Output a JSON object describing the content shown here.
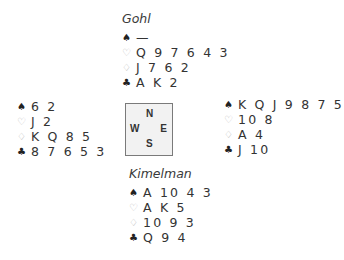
{
  "diagram": {
    "type": "bridge-deal",
    "compass": {
      "north": "N",
      "south": "S",
      "east": "E",
      "west": "W"
    },
    "suit_icons": {
      "spades": "♠",
      "hearts": "♡",
      "diamonds": "♢",
      "clubs": "♣"
    },
    "colors": {
      "black_suit": "#222222",
      "red_suit_outline": "#b8b8b8",
      "compass_fill": "#f2f2f2",
      "compass_border": "#7a7a7a"
    },
    "north": {
      "name": "Gohl",
      "spades": "—",
      "hearts": "Q 9 7 6 4 3",
      "diamonds": "J 7 6 2",
      "clubs": "A K 2"
    },
    "west": {
      "spades": "6 2",
      "hearts": "J 2",
      "diamonds": "K Q 8 5",
      "clubs": "8 7 6 5 3"
    },
    "east": {
      "spades": "K Q J 9 8 7 5",
      "hearts": "10 8",
      "diamonds": "A 4",
      "clubs": "J 10"
    },
    "south": {
      "name": "Kimelman",
      "spades": "A 10 4 3",
      "hearts": "A K 5",
      "diamonds": "10 9 3",
      "clubs": "Q 9 4"
    }
  }
}
